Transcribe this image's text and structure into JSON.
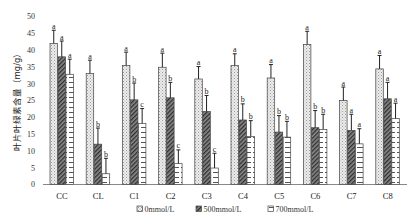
{
  "chart_data": {
    "type": "bar",
    "title": "",
    "xlabel": "",
    "ylabel": "叶片叶绿素含量（mg/g）",
    "ylim": [
      0,
      50
    ],
    "yticks": [
      0,
      5,
      10,
      15,
      20,
      25,
      30,
      35,
      40,
      45,
      50
    ],
    "grid": false,
    "legend_position": "bottom",
    "categories": [
      "CC",
      "CL",
      "C1",
      "C2",
      "C3",
      "C4",
      "C5",
      "C6",
      "C7",
      "C8"
    ],
    "series": [
      {
        "name": "0mmol/L",
        "pattern": "light-crosshatch",
        "values": [
          42.0,
          33.0,
          35.4,
          34.9,
          31.4,
          35.4,
          31.7,
          41.7,
          25.0,
          34.4
        ],
        "errors": [
          3.9,
          4.0,
          4.0,
          4.2,
          3.7,
          3.5,
          4.0,
          3.9,
          4.0,
          4.0
        ],
        "letters": [
          "a",
          "a",
          "a",
          "a",
          "a",
          "a",
          "a",
          "a",
          "a",
          "a"
        ]
      },
      {
        "name": "500mmol/L",
        "pattern": "dark-diagonal",
        "values": [
          38.0,
          12.0,
          25.2,
          25.8,
          21.7,
          19.2,
          15.6,
          16.9,
          16.1,
          25.5
        ],
        "errors": [
          4.7,
          4.8,
          5.0,
          4.6,
          4.8,
          4.8,
          4.9,
          5.1,
          4.8,
          4.9
        ],
        "letters": [
          "a",
          "b",
          "b",
          "b",
          "b",
          "b",
          "b",
          "b",
          "a",
          "a"
        ]
      },
      {
        "name": "700mmol/L",
        "pattern": "white-brick",
        "values": [
          32.8,
          3.2,
          18.2,
          6.2,
          4.9,
          14.3,
          14.1,
          16.4,
          12.1,
          19.6
        ],
        "errors": [
          4.5,
          4.6,
          4.4,
          4.1,
          4.4,
          4.7,
          4.7,
          4.5,
          4.5,
          4.6
        ],
        "letters": [
          "a",
          "b",
          "c",
          "c",
          "c",
          "b",
          "b",
          "b",
          "a",
          "a"
        ]
      }
    ]
  },
  "legend": {
    "items": [
      {
        "label": "0mmol/L"
      },
      {
        "label": "500mmol/L"
      },
      {
        "label": "700mmol/L"
      }
    ]
  }
}
